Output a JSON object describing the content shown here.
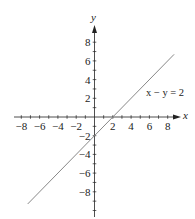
{
  "chart_data": {
    "type": "line",
    "title": "",
    "xlabel": "x",
    "ylabel": "y",
    "xlim": [
      -8,
      8
    ],
    "ylim": [
      -9,
      9
    ],
    "grid": false,
    "xticks": [
      -8,
      -6,
      -4,
      -2,
      2,
      4,
      6,
      8
    ],
    "yticks": [
      8,
      6,
      4,
      2,
      -2,
      -4,
      -6,
      -8
    ],
    "xtick_labels": [
      "−8",
      "−6",
      "−4",
      "−2",
      "2",
      "4",
      "6",
      "8"
    ],
    "ytick_labels": [
      "8",
      "6",
      "4",
      "2",
      "−2",
      "−4",
      "−6",
      "−8"
    ],
    "series": [
      {
        "name": "x − y = 2",
        "equation": "y = x − 2",
        "x": [
          -7.3,
          8.7
        ],
        "y": [
          -9.3,
          6.7
        ],
        "color": "#888888"
      }
    ],
    "annotations": [
      {
        "text": "x − y = 2",
        "x": 5.6,
        "y": 2.6
      }
    ]
  },
  "colors": {
    "axis": "#222222",
    "line": "#888888",
    "background": "#ffffff"
  }
}
